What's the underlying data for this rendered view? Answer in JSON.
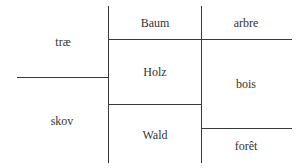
{
  "diagram": {
    "type": "semantic-field-comparison",
    "columns": [
      {
        "language": "Danish",
        "words": [
          {
            "id": "trae",
            "label": "træ",
            "cx": 63,
            "cy": 42
          },
          {
            "id": "skov",
            "label": "skov",
            "cx": 62,
            "cy": 121
          }
        ]
      },
      {
        "language": "German",
        "words": [
          {
            "id": "baum",
            "label": "Baum",
            "cx": 155,
            "cy": 23
          },
          {
            "id": "holz",
            "label": "Holz",
            "cx": 155,
            "cy": 72
          },
          {
            "id": "wald",
            "label": "Wald",
            "cx": 155,
            "cy": 135
          }
        ]
      },
      {
        "language": "French",
        "words": [
          {
            "id": "arbre",
            "label": "arbre",
            "cx": 246,
            "cy": 23
          },
          {
            "id": "bois",
            "label": "bois",
            "cx": 246,
            "cy": 84
          },
          {
            "id": "foret",
            "label": "forêt",
            "cx": 246,
            "cy": 146
          }
        ]
      }
    ],
    "line_color": "#3a3a3a",
    "text_color": "#333333"
  }
}
